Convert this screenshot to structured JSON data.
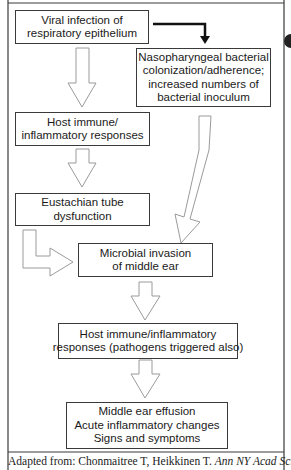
{
  "diagram": {
    "nodes": [
      {
        "id": "viral",
        "lines": [
          "Viral infection of",
          "respiratory epithelium"
        ]
      },
      {
        "id": "bacterial",
        "lines": [
          "Nasopharyngeal bacterial",
          "colonization/adherence;",
          "increased numbers of",
          "bacterial inoculum"
        ]
      },
      {
        "id": "host1",
        "lines": [
          "Host immune/",
          "inflammatory responses"
        ]
      },
      {
        "id": "eustachian",
        "lines": [
          "Eustachian tube",
          "dysfunction"
        ]
      },
      {
        "id": "invasion",
        "lines": [
          "Microbial invasion",
          "of middle ear"
        ]
      },
      {
        "id": "host2",
        "lines": [
          "Host immune/inflammatory",
          "responses (pathogens triggered also)"
        ]
      },
      {
        "id": "outcome",
        "lines": [
          "Middle ear effusion",
          "Acute inflammatory changes",
          "Signs and symptoms"
        ]
      }
    ],
    "edges": [
      {
        "from": "viral",
        "to": "bacterial",
        "style": "solid-black"
      },
      {
        "from": "viral",
        "to": "host1",
        "style": "hollow"
      },
      {
        "from": "host1",
        "to": "eustachian",
        "style": "hollow"
      },
      {
        "from": "eustachian",
        "to": "invasion",
        "style": "hollow-elbow"
      },
      {
        "from": "bacterial",
        "to": "invasion",
        "style": "hollow-diagonal"
      },
      {
        "from": "invasion",
        "to": "host2",
        "style": "hollow"
      },
      {
        "from": "host2",
        "to": "outcome",
        "style": "hollow"
      }
    ],
    "caption": {
      "prefix": "Adapted from: Chonmaitree T, Heikkinen T. ",
      "journal": "Ann NY Acad Sci."
    }
  },
  "colors": {
    "line": "#3a3a3a",
    "arrow_outline": "#9a9a9a",
    "black_arrow": "#111111"
  }
}
